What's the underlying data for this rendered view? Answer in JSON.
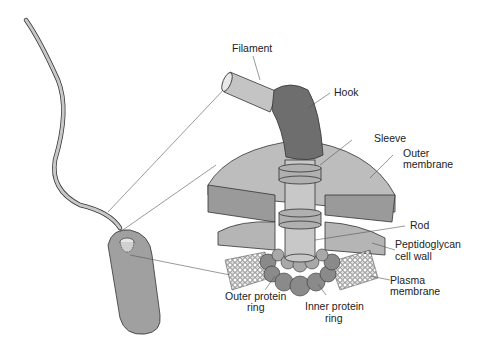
{
  "diagram": {
    "labels": {
      "filament": "Filament",
      "hook": "Hook",
      "sleeve": "Sleeve",
      "outer_membrane_1": "Outer",
      "outer_membrane_2": "membrane",
      "rod": "Rod",
      "peptidoglycan_1": "Peptidoglycan",
      "peptidoglycan_2": "cell wall",
      "plasma_1": "Plasma",
      "plasma_2": "membrane",
      "outer_ring_1": "Outer protein",
      "outer_ring_2": "ring",
      "inner_ring_1": "Inner protein",
      "inner_ring_2": "ring"
    },
    "colors": {
      "light_gray": "#c4c4c4",
      "mid_gray": "#a8a8a8",
      "dark_gray": "#8a8a8a",
      "hook": "#6e6e6e",
      "cell": "#a0a0a0",
      "outline": "#333333"
    }
  }
}
